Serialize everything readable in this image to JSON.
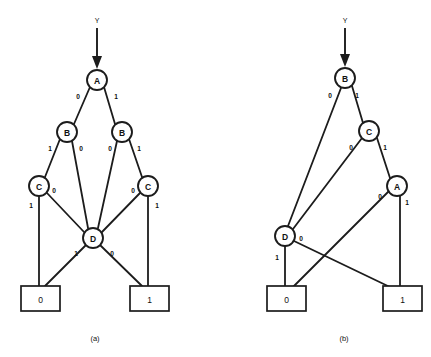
{
  "figure": {
    "input_signal_label": "Y",
    "panels": [
      {
        "id": "a",
        "caption": "(a)",
        "input_label": "Y",
        "nodes": [
          {
            "id": "A",
            "label": "A",
            "x": 97,
            "y": 80,
            "r": 10
          },
          {
            "id": "B1",
            "label": "B",
            "x": 67,
            "y": 132,
            "r": 10
          },
          {
            "id": "B2",
            "label": "B",
            "x": 122,
            "y": 132,
            "r": 10
          },
          {
            "id": "C1",
            "label": "C",
            "x": 39,
            "y": 186,
            "r": 10
          },
          {
            "id": "C2",
            "label": "C",
            "x": 148,
            "y": 186,
            "r": 10
          },
          {
            "id": "D",
            "label": "D",
            "x": 93,
            "y": 238,
            "r": 10
          }
        ],
        "terminals": [
          {
            "id": "T0",
            "label": "0",
            "x": 21,
            "y": 286,
            "w": 39,
            "h": 25
          },
          {
            "id": "T1",
            "label": "1",
            "x": 130,
            "y": 286,
            "w": 39,
            "h": 25
          }
        ],
        "edges": [
          {
            "from": "A",
            "to": "B1",
            "label": "0",
            "lx": 78,
            "ly": 96
          },
          {
            "from": "A",
            "to": "B2",
            "label": "1",
            "lx": 116,
            "ly": 96
          },
          {
            "from": "B1",
            "to": "C1",
            "label": "1",
            "lx": 50,
            "ly": 148
          },
          {
            "from": "B1",
            "to": "D",
            "label": "0",
            "lx": 81,
            "ly": 148
          },
          {
            "from": "B2",
            "to": "D",
            "label": "0",
            "lx": 110,
            "ly": 148
          },
          {
            "from": "B2",
            "to": "C2",
            "label": "1",
            "lx": 139,
            "ly": 148
          },
          {
            "from": "C1",
            "to": "T0",
            "label": "1",
            "lx": 31,
            "ly": 205
          },
          {
            "from": "C1",
            "to": "D",
            "label": "0",
            "lx": 54,
            "ly": 190
          },
          {
            "from": "C2",
            "to": "D",
            "label": "0",
            "lx": 133,
            "ly": 190
          },
          {
            "from": "C2",
            "to": "T1",
            "label": "1",
            "lx": 157,
            "ly": 205
          },
          {
            "from": "D",
            "to": "T0",
            "label": "1",
            "lx": 76,
            "ly": 253
          },
          {
            "from": "D",
            "to": "T1",
            "label": "0",
            "lx": 112,
            "ly": 253
          }
        ]
      },
      {
        "id": "b",
        "caption": "(b)",
        "input_label": "Y",
        "nodes": [
          {
            "id": "B",
            "label": "B",
            "x": 345,
            "y": 78,
            "r": 10
          },
          {
            "id": "C",
            "label": "C",
            "x": 369,
            "y": 131,
            "r": 10
          },
          {
            "id": "A",
            "label": "A",
            "x": 397,
            "y": 186,
            "r": 10
          },
          {
            "id": "D",
            "label": "D",
            "x": 285,
            "y": 236,
            "r": 10
          }
        ],
        "terminals": [
          {
            "id": "T0",
            "label": "0",
            "x": 267,
            "y": 286,
            "w": 39,
            "h": 25
          },
          {
            "id": "T1",
            "label": "1",
            "x": 383,
            "y": 286,
            "w": 39,
            "h": 25
          }
        ],
        "edges": [
          {
            "from": "B",
            "to": "D",
            "label": "0",
            "lx": 330,
            "ly": 95
          },
          {
            "from": "B",
            "to": "C",
            "label": "1",
            "lx": 357,
            "ly": 95
          },
          {
            "from": "C",
            "to": "D",
            "label": "0",
            "lx": 351,
            "ly": 147
          },
          {
            "from": "C",
            "to": "A",
            "label": "1",
            "lx": 385,
            "ly": 147
          },
          {
            "from": "A",
            "to": "T0",
            "label": "0",
            "lx": 380,
            "ly": 196
          },
          {
            "from": "A",
            "to": "T1",
            "label": "1",
            "lx": 406,
            "ly": 202
          },
          {
            "from": "D",
            "to": "T1",
            "label": "0",
            "lx": 301,
            "ly": 238
          },
          {
            "from": "D",
            "to": "T0",
            "label": "1",
            "lx": 277,
            "ly": 257
          }
        ]
      }
    ]
  }
}
